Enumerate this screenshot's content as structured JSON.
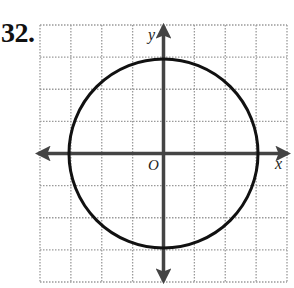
{
  "problem": {
    "number": "32."
  },
  "graph": {
    "grid": {
      "columns": 8,
      "rows": 8,
      "x_min": -4,
      "x_max": 4,
      "y_min": -4,
      "y_max": 4,
      "line_style": "dotted",
      "line_color": "#9a9a9a"
    },
    "axes": {
      "x_label": "x",
      "y_label": "y",
      "origin_label": "O",
      "color": "#444444"
    },
    "circle": {
      "center": [
        0,
        0
      ],
      "radius": 3,
      "color": "#111111"
    }
  }
}
